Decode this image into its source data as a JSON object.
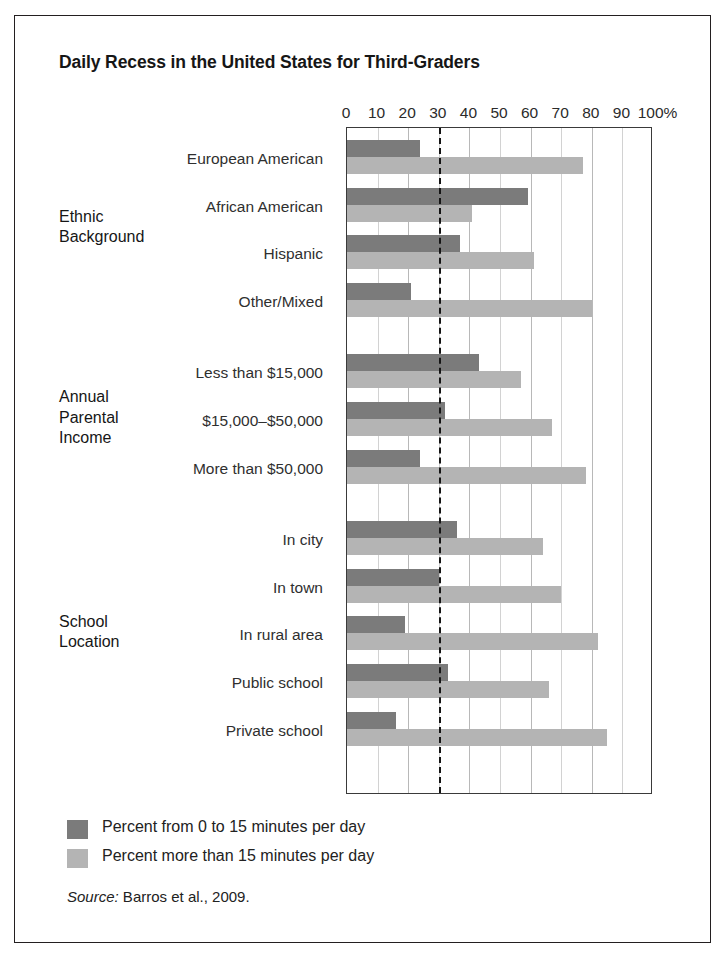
{
  "figure": {
    "title": "Daily Recess in the United States for Third-Graders",
    "source_prefix": "Source:",
    "source_text": " Barros et al., 2009."
  },
  "legend": {
    "position": "bottom-left",
    "items": [
      {
        "label": "Percent from 0 to 15 minutes per day",
        "color": "#7b7b7b",
        "swatch": "dark-swatch"
      },
      {
        "label": "Percent more than 15 minutes per day",
        "color": "#b4b4b4",
        "swatch": "light-swatch"
      }
    ]
  },
  "axis": {
    "ticks": [
      "0",
      "10",
      "20",
      "30",
      "40",
      "50",
      "60",
      "70",
      "80",
      "90",
      "100"
    ],
    "unit_suffix": "%",
    "reference_line_value": 30
  },
  "groups": [
    {
      "label": "Ethnic\nBackground",
      "line1": "Ethnic",
      "line2": "Background"
    },
    {
      "label": "Annual\nParental\nIncome",
      "line1": "Annual",
      "line2": "Parental",
      "line3": "Income"
    },
    {
      "label": "School\nLocation",
      "line1": "School",
      "line2": "Location"
    }
  ],
  "chart_data": {
    "type": "bar",
    "orientation": "horizontal",
    "title": "Daily Recess in the United States for Third-Graders",
    "xlabel": "",
    "ylabel": "",
    "xlim": [
      0,
      100
    ],
    "x_unit": "%",
    "grid": true,
    "gridlines_at": [
      10,
      20,
      30,
      40,
      50,
      60,
      70,
      80,
      90
    ],
    "reference_line": {
      "value": 30,
      "style": "dashed",
      "color": "#141414"
    },
    "legend_position": "bottom-left",
    "categories": [
      "European American",
      "African American",
      "Hispanic",
      "Other/Mixed",
      "Less than $15,000",
      "$15,000–$50,000",
      "More than $50,000",
      "In city",
      "In town",
      "In rural area",
      "Public school",
      "Private school"
    ],
    "category_groups": [
      {
        "name": "Ethnic Background",
        "categories": [
          "European American",
          "African American",
          "Hispanic",
          "Other/Mixed"
        ]
      },
      {
        "name": "Annual Parental Income",
        "categories": [
          "Less than $15,000",
          "$15,000–$50,000",
          "More than $50,000"
        ]
      },
      {
        "name": "School Location",
        "categories": [
          "In city",
          "In town",
          "In rural area",
          "Public school",
          "Private school"
        ]
      }
    ],
    "series": [
      {
        "name": "Percent from 0 to 15 minutes per day",
        "color": "#7b7b7b",
        "values": [
          24,
          59,
          37,
          21,
          43,
          32,
          24,
          36,
          30,
          19,
          33,
          16
        ]
      },
      {
        "name": "Percent more than 15 minutes per day",
        "color": "#b4b4b4",
        "values": [
          77,
          41,
          61,
          80,
          57,
          67,
          78,
          64,
          70,
          82,
          66,
          85
        ]
      }
    ]
  }
}
